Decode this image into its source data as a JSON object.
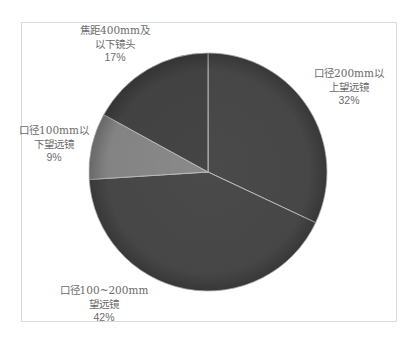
{
  "chart_data": {
    "type": "pie",
    "title": "",
    "categories": [
      "口径200mm以上望远镜",
      "口径100~200mm望远镜",
      "口径100mm以下望远镜",
      "焦距400mm及以下镜头"
    ],
    "values": [
      32,
      42,
      9,
      17
    ],
    "unit": "%",
    "start_angle_deg": 0,
    "direction": "clockwise",
    "colors": [
      "#4a4a4a",
      "#4a4a4a",
      "#8a8a8a",
      "#454545"
    ],
    "legend": "none",
    "data_labels": true
  },
  "labels": [
    {
      "line1": "口径200mm以",
      "line2": "上望远镜",
      "pct": "32%"
    },
    {
      "line1": "口径100~200mm",
      "line2": "望远镜",
      "pct": "42%"
    },
    {
      "line1": "口径100mm以",
      "line2": "下望远镜",
      "pct": "9%"
    },
    {
      "line1": "焦距400mm及",
      "line2": "以下镜头",
      "pct": "17%"
    }
  ]
}
